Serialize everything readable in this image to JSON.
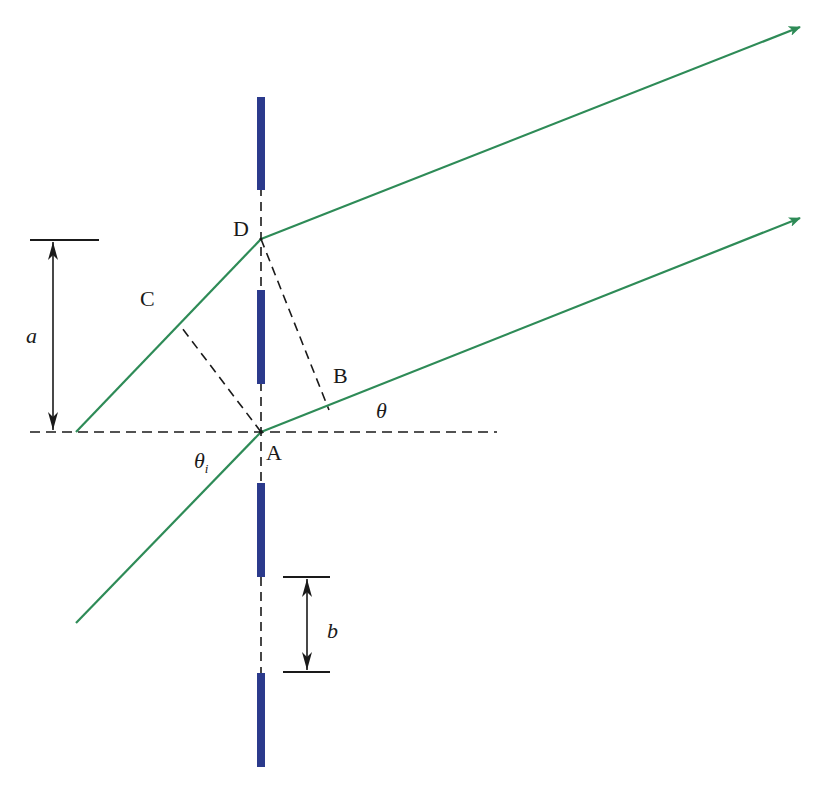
{
  "figure": {
    "type": "grating diffraction geometry",
    "colors": {
      "ray": "#2e8b57",
      "grating_bar": "#2b3a8c",
      "construction_line": "#1a1a1a",
      "background": "#ffffff"
    }
  },
  "labels": {
    "point_d": "D",
    "point_c": "C",
    "point_b": "B",
    "point_a": "A",
    "angle_theta": "θ",
    "angle_theta_i": "θ",
    "angle_theta_i_sub": "i",
    "dim_a": "a",
    "dim_b": "b"
  },
  "elements": {
    "grating_bars": [
      {
        "x": 261,
        "y1": 97,
        "y2": 190
      },
      {
        "x": 261,
        "y1": 290,
        "y2": 384
      },
      {
        "x": 261,
        "y1": 483,
        "y2": 577
      },
      {
        "x": 261,
        "y1": 673,
        "y2": 767
      }
    ],
    "points": {
      "A": [
        261,
        432
      ],
      "D": [
        261,
        239
      ],
      "C": [
        179,
        324
      ],
      "B": [
        329,
        410
      ]
    },
    "rays": {
      "incident_lower": {
        "from": [
          76,
          623
        ],
        "to": [
          261,
          432
        ]
      },
      "incident_upper": {
        "from": [
          76,
          432
        ],
        "to": [
          261,
          239
        ]
      },
      "diffracted_lower": {
        "from": [
          261,
          432
        ],
        "to": [
          800,
          218
        ]
      },
      "diffracted_upper": {
        "from": [
          261,
          239
        ],
        "to": [
          800,
          27
        ]
      }
    },
    "dimension_a": {
      "x": 53,
      "y_top": 240,
      "y_bottom": 432
    },
    "dimension_b": {
      "x": 307,
      "y_top": 577,
      "y_bottom": 672
    }
  }
}
